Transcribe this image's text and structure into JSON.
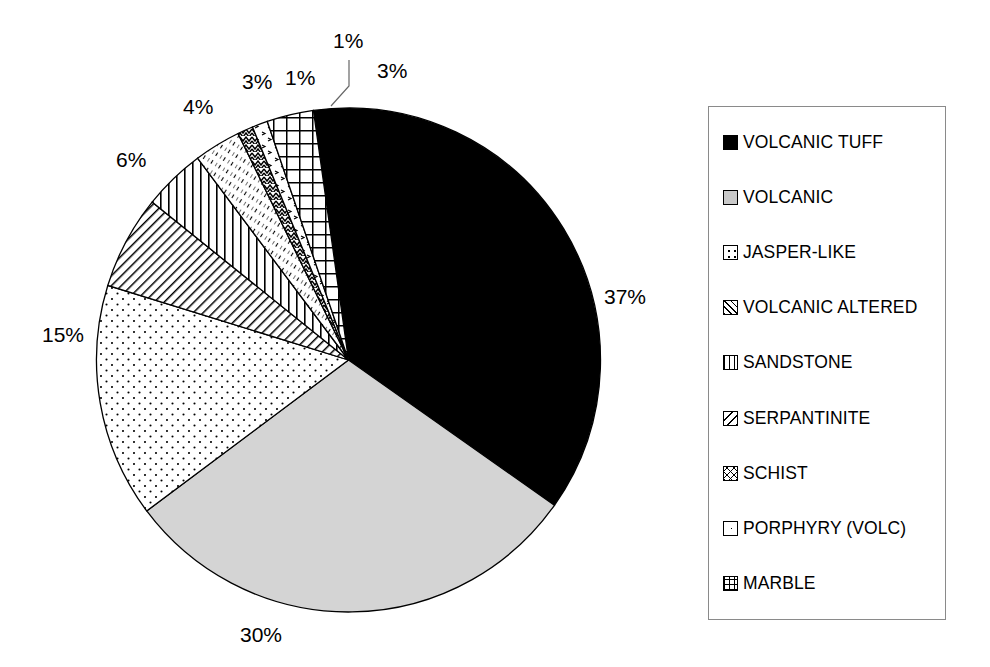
{
  "chart_data": {
    "type": "pie",
    "title": "",
    "categories": [
      "VOLCANIC TUFF",
      "VOLCANIC",
      "JASPER-LIKE",
      "VOLCANIC ALTERED",
      "SANDSTONE",
      "SERPANTINITE",
      "SCHIST",
      "PORPHYRY (VOLC)",
      "MARBLE"
    ],
    "values": [
      37,
      30,
      15,
      6,
      4,
      3,
      1,
      1,
      3
    ],
    "value_labels": [
      "37%",
      "30%",
      "15%",
      "6%",
      "4%",
      "3%",
      "1%",
      "1%",
      "3%"
    ],
    "units": "percent",
    "start_angle_deg": -8,
    "direction": "clockwise",
    "legend_position": "right",
    "grid": false,
    "patterns": [
      "solid-black",
      "solid-light-gray",
      "sparse-dots",
      "diagonal-hatch",
      "vertical-lines",
      "fine-diagonal-hatch",
      "zigzag",
      "sparse-marks",
      "grid-crosshatch"
    ],
    "colors": {
      "outline": "#000000",
      "background": "#ffffff",
      "volcanic_tuff_fill": "#000000",
      "volcanic_fill": "#d4d4d4",
      "legend_border": "#8a8a8a"
    },
    "leader_lines": [
      {
        "label": "1%",
        "for": "PORPHYRY (VOLC)"
      }
    ]
  },
  "pie_labels": [
    {
      "text": "37%",
      "name": "pie-label-volcanic-tuff"
    },
    {
      "text": "30%",
      "name": "pie-label-volcanic"
    },
    {
      "text": "15%",
      "name": "pie-label-jasper-like"
    },
    {
      "text": "6%",
      "name": "pie-label-volcanic-altered"
    },
    {
      "text": "4%",
      "name": "pie-label-sandstone"
    },
    {
      "text": "3%",
      "name": "pie-label-serpantinite"
    },
    {
      "text": "1%",
      "name": "pie-label-schist"
    },
    {
      "text": "1%",
      "name": "pie-label-porphyry"
    },
    {
      "text": "3%",
      "name": "pie-label-marble"
    }
  ],
  "legend": {
    "items": [
      {
        "label": "VOLCANIC TUFF",
        "pattern": "solid-black"
      },
      {
        "label": "VOLCANIC",
        "pattern": "solid-light-gray"
      },
      {
        "label": "JASPER-LIKE",
        "pattern": "sparse-dots"
      },
      {
        "label": "VOLCANIC ALTERED",
        "pattern": "diagonal-hatch"
      },
      {
        "label": "SANDSTONE",
        "pattern": "vertical-lines"
      },
      {
        "label": "SERPANTINITE",
        "pattern": "fine-diagonal-hatch"
      },
      {
        "label": "SCHIST",
        "pattern": "zigzag"
      },
      {
        "label": "PORPHYRY (VOLC)",
        "pattern": "sparse-marks"
      },
      {
        "label": "MARBLE",
        "pattern": "grid-crosshatch"
      }
    ]
  }
}
